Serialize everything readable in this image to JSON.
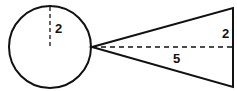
{
  "diagram": {
    "colors": {
      "stroke": "#111111",
      "background": "#ffffff"
    },
    "circle": {
      "radius_label": "2",
      "cx": 50,
      "cy": 47,
      "r": 41
    },
    "triangle": {
      "apex": [
        92,
        47
      ],
      "top": [
        233,
        8
      ],
      "bottom": [
        233,
        87
      ],
      "height_label": "5",
      "half_base_label": "2"
    }
  }
}
